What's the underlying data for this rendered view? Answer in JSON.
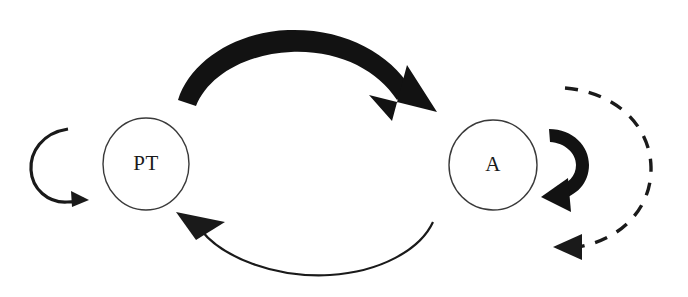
{
  "figure": {
    "type": "cycle-diagram",
    "background_color": "#ffffff",
    "ink_color": "#121212",
    "node_stroke_color": "#3a3a3a",
    "width": 688,
    "height": 297
  },
  "nodes": [
    {
      "id": "PT",
      "label": "PT",
      "shape": "ellipse",
      "cx": 146,
      "cy": 164,
      "rx": 43,
      "ry": 46
    },
    {
      "id": "A",
      "label": "A",
      "shape": "ellipse",
      "cx": 493,
      "cy": 165,
      "rx": 44,
      "ry": 45
    }
  ],
  "edges": [
    {
      "id": "pt-self-loop",
      "name": "pt-self-loop",
      "from": "PT",
      "to": "PT",
      "style": "solid",
      "weight": "thin",
      "side": "left",
      "direction": "clockwise",
      "arrowhead": "bottom-right"
    },
    {
      "id": "pt-to-a",
      "name": "pt-to-a-thick-arrow",
      "from": "PT",
      "to": "A",
      "style": "solid",
      "weight": "thick",
      "side": "top",
      "direction": "left-to-right",
      "arrowhead": "down-right"
    },
    {
      "id": "a-to-pt",
      "name": "a-to-pt-thin-arrow",
      "from": "A",
      "to": "PT",
      "style": "solid",
      "weight": "thin",
      "side": "bottom",
      "direction": "right-to-left",
      "arrowhead": "up-left"
    },
    {
      "id": "a-self-loop",
      "name": "a-self-loop-thick",
      "from": "A",
      "to": "A",
      "style": "solid",
      "weight": "thick",
      "side": "right",
      "direction": "counter-clockwise",
      "arrowhead": "bottom-left"
    },
    {
      "id": "a-outer-dashed-loop",
      "name": "a-outer-dashed-loop",
      "from": "A",
      "to": "A",
      "style": "dashed",
      "weight": "medium",
      "side": "far-right",
      "direction": "counter-clockwise",
      "arrowhead": "left"
    }
  ]
}
